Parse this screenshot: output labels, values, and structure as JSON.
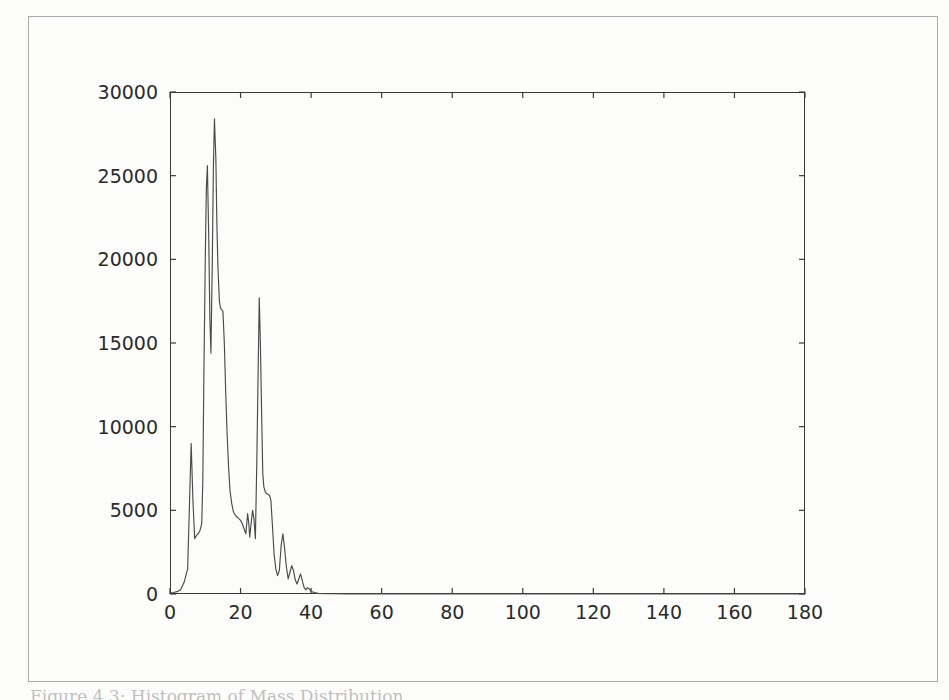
{
  "page": {
    "background_color": "#fcfcfa",
    "border_color": "#a9a9a9",
    "caption": "Figure 4.3: Histogram of Mass Distribution"
  },
  "chart_data": {
    "type": "line",
    "title": "",
    "xlabel": "",
    "ylabel": "",
    "xlim": [
      0,
      180
    ],
    "ylim": [
      0,
      30000
    ],
    "grid": false,
    "legend": false,
    "line_color": "#4a4a4a",
    "axis_color": "#3a3a3a",
    "x_ticks": [
      0,
      20,
      40,
      60,
      80,
      100,
      120,
      140,
      160,
      180
    ],
    "y_ticks": [
      0,
      5000,
      10000,
      15000,
      20000,
      25000,
      30000
    ],
    "x_tick_labels": [
      "0",
      "20",
      "40",
      "60",
      "80",
      "100",
      "120",
      "140",
      "160",
      "180"
    ],
    "y_tick_labels": [
      "0",
      "5000",
      "10000",
      "15000",
      "20000",
      "25000",
      "30000"
    ],
    "series": [
      {
        "name": "counts",
        "x": [
          0,
          1,
          2,
          3,
          4,
          5,
          5.5,
          6,
          6.5,
          7,
          7.5,
          8,
          8.5,
          9,
          9.3,
          9.6,
          10,
          10.3,
          10.6,
          11,
          11.3,
          11.6,
          12,
          12.3,
          12.6,
          13,
          13.3,
          13.6,
          14,
          14.3,
          14.6,
          15,
          15.4,
          15.8,
          16.2,
          16.6,
          17,
          17.5,
          18,
          18.5,
          19,
          19.5,
          20,
          20.5,
          21,
          21.5,
          22,
          22.3,
          22.6,
          23,
          23.4,
          23.8,
          24.2,
          24.6,
          25,
          25.3,
          25.6,
          26,
          26.3,
          26.6,
          27,
          27.4,
          27.8,
          28.2,
          28.6,
          29,
          29.5,
          30,
          30.5,
          31,
          31.5,
          32,
          32.5,
          33,
          33.5,
          34,
          34.5,
          35,
          35.5,
          36,
          36.5,
          37,
          37.5,
          38,
          38.5,
          39,
          39.5,
          40,
          41,
          42,
          44,
          46,
          50,
          60,
          70,
          80,
          100,
          120,
          140,
          160,
          180
        ],
        "y": [
          60,
          90,
          140,
          260,
          700,
          1500,
          5200,
          9000,
          5600,
          3300,
          3500,
          3600,
          3800,
          4200,
          6800,
          13000,
          20000,
          24200,
          25600,
          21000,
          16500,
          14400,
          20000,
          25500,
          28400,
          26000,
          22000,
          19500,
          17500,
          17100,
          17000,
          16900,
          15000,
          12000,
          9500,
          7600,
          6200,
          5400,
          4900,
          4700,
          4600,
          4500,
          4400,
          4200,
          3900,
          3600,
          4800,
          4300,
          3400,
          4200,
          5000,
          4500,
          3300,
          7800,
          13500,
          17700,
          15200,
          10500,
          7200,
          6400,
          6100,
          6000,
          5950,
          5900,
          5600,
          4200,
          2400,
          1500,
          1100,
          1400,
          2900,
          3600,
          2700,
          1600,
          900,
          1300,
          1700,
          1400,
          850,
          600,
          900,
          1200,
          800,
          400,
          250,
          380,
          300,
          150,
          80,
          40,
          25,
          15,
          10,
          6,
          5,
          4,
          3,
          3,
          2,
          2,
          2
        ]
      }
    ]
  }
}
